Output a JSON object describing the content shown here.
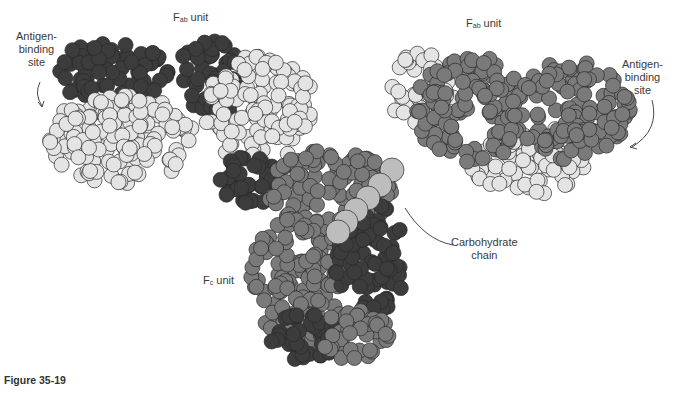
{
  "figure": {
    "caption": "Figure 35-19",
    "labels": {
      "fab_left": {
        "main": "F",
        "sub": "ab",
        "suffix": " unit"
      },
      "fab_right": {
        "main": "F",
        "sub": "ab",
        "suffix": " unit"
      },
      "fc": {
        "main": "F",
        "sub": "c",
        "suffix": " unit"
      },
      "antigen_left": [
        "Antigen-",
        "binding",
        "site"
      ],
      "antigen_right": [
        "Antigen-",
        "binding",
        "site"
      ],
      "carbohydrate": [
        "Carbohydrate",
        "chain"
      ]
    },
    "colors": {
      "heavy_dark": "#3c3c3c",
      "heavy_mid": "#7a7a7a",
      "light_chain": "#e4e4e4",
      "carbohydrate": "#bdbdbd",
      "outline": "#2a2a2a"
    }
  }
}
